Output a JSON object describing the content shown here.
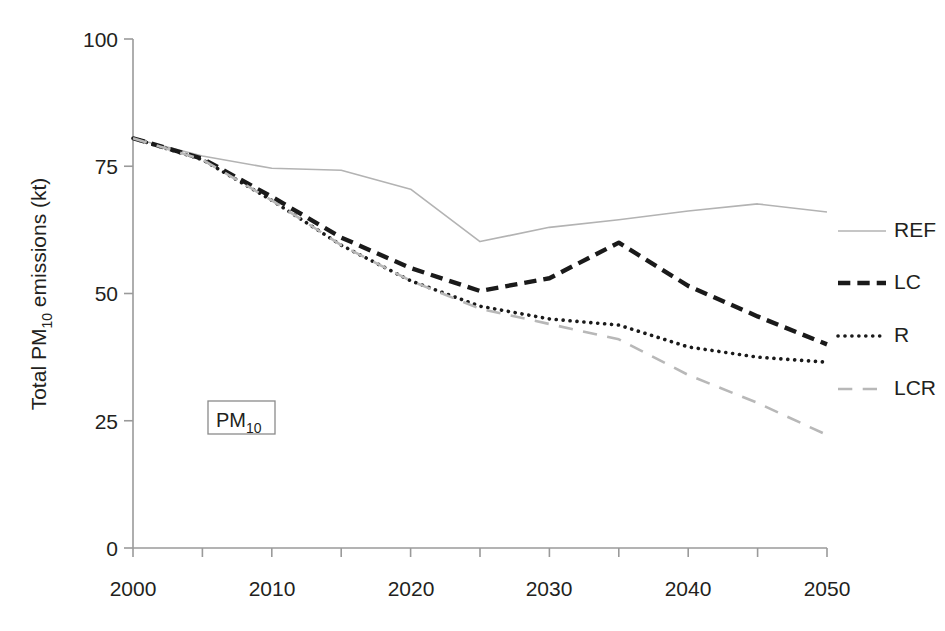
{
  "chart_data": {
    "type": "line",
    "title": "",
    "xlabel": "",
    "ylabel": "Total PM10 emissions (kt)",
    "ylabel_parts": {
      "prefix": "Total PM",
      "sub": "10",
      "suffix": " emissions (kt)"
    },
    "x": [
      2000,
      2005,
      2010,
      2015,
      2020,
      2025,
      2030,
      2035,
      2040,
      2045,
      2050
    ],
    "xlim": [
      2000,
      2050
    ],
    "ylim": [
      0,
      100
    ],
    "xticks": [
      2000,
      2010,
      2020,
      2030,
      2040,
      2050
    ],
    "xtick_labels": [
      "2000",
      "2010",
      "2020",
      "2030",
      "2040",
      "2050"
    ],
    "x_minor_ticks": [
      2005,
      2015,
      2025,
      2035,
      2045
    ],
    "yticks": [
      0,
      25,
      50,
      75,
      100
    ],
    "ytick_labels": [
      "0",
      "25",
      "50",
      "75",
      "100"
    ],
    "grid": false,
    "legend_position": "right",
    "annotations": [
      {
        "text": "PM10",
        "text_prefix": "PM",
        "text_sub": "10",
        "x": 2009,
        "y": 26,
        "boxed": true
      }
    ],
    "series": [
      {
        "name": "REF",
        "style": "solid",
        "color": "#b3b3b3",
        "width": 1.6,
        "values": [
          80.5,
          77.0,
          74.6,
          74.2,
          70.5,
          60.2,
          63.0,
          64.5,
          66.2,
          67.6,
          66.0
        ]
      },
      {
        "name": "LC",
        "style": "dashed",
        "color": "#1a1a1a",
        "width": 4.4,
        "values": [
          80.5,
          76.5,
          69.0,
          61.0,
          55.0,
          50.5,
          53.0,
          60.0,
          51.5,
          45.5,
          40.0
        ]
      },
      {
        "name": "R",
        "style": "dotted",
        "color": "#1a1a1a",
        "width": 3.6,
        "values": [
          80.5,
          76.3,
          68.3,
          59.5,
          52.5,
          47.5,
          45.0,
          43.8,
          39.5,
          37.5,
          36.5
        ]
      },
      {
        "name": "LCR",
        "style": "longdash",
        "color": "#b8b8b8",
        "width": 2.6,
        "values": [
          80.5,
          76.3,
          68.3,
          59.5,
          52.5,
          47.0,
          44.0,
          41.0,
          34.0,
          28.5,
          22.2
        ]
      }
    ]
  },
  "legend": {
    "items": [
      {
        "label": "REF"
      },
      {
        "label": "LC"
      },
      {
        "label": "R"
      },
      {
        "label": "LCR"
      }
    ]
  },
  "axes": {
    "y_title": "Total PM10 emissions (kt)",
    "y_tick_0": "0",
    "y_tick_25": "25",
    "y_tick_50": "50",
    "y_tick_75": "75",
    "y_tick_100": "100",
    "x_tick_2000": "2000",
    "x_tick_2010": "2010",
    "x_tick_2020": "2020",
    "x_tick_2030": "2030",
    "x_tick_2040": "2040",
    "x_tick_2050": "2050"
  },
  "annotation_box": {
    "prefix": "PM",
    "subscript": "10"
  },
  "colors": {
    "axis": "#9a9a9a",
    "text": "#231f20",
    "ref": "#b3b3b3",
    "lc": "#1a1a1a",
    "r": "#1a1a1a",
    "lcr": "#b8b8b8"
  }
}
